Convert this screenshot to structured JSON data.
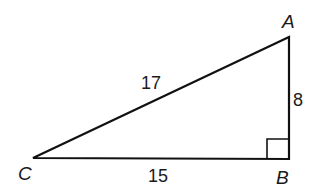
{
  "diagram": {
    "type": "right-triangle",
    "stroke_color": "#111111",
    "vertices": {
      "A": {
        "label": "A",
        "x": 289,
        "y": 37
      },
      "B": {
        "label": "B",
        "x": 289,
        "y": 159
      },
      "C": {
        "label": "C",
        "x": 33,
        "y": 158
      }
    },
    "sides": {
      "CA": {
        "label": "17"
      },
      "AB": {
        "label": "8"
      },
      "CB": {
        "label": "15"
      }
    },
    "right_angle_at": "B"
  }
}
